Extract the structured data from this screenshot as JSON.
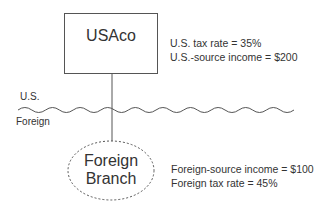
{
  "diagram": {
    "parent_entity": {
      "name": "USAco",
      "shape": "rectangle",
      "details": [
        "U.S. tax rate = 35%",
        "U.S.-source income = $200"
      ]
    },
    "boundary": {
      "upper_label": "U.S.",
      "lower_label": "Foreign",
      "style": "wavy-line"
    },
    "child_entity": {
      "name_line1": "Foreign",
      "name_line2": "Branch",
      "shape": "dashed-ellipse",
      "details": [
        "Foreign-source income = $100",
        "Foreign tax rate = 45%"
      ]
    },
    "colors": {
      "stroke": "#555555",
      "text": "#333333",
      "background": "#ffffff"
    }
  }
}
